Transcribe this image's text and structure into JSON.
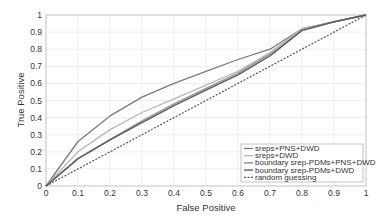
{
  "chart_data": {
    "type": "line",
    "title": "",
    "xlabel": "False Positive",
    "ylabel": "True Positive",
    "xlim": [
      0,
      1
    ],
    "ylim": [
      0,
      1
    ],
    "grid": true,
    "legend_position": "lower right",
    "x_ticks": [
      "0",
      "0.1",
      "0.2",
      "0.3",
      "0.4",
      "0.5",
      "0.6",
      "0.7",
      "0.8",
      "0.9",
      "1"
    ],
    "y_ticks": [
      "0",
      "0.1",
      "0.2",
      "0.3",
      "0.4",
      "0.5",
      "0.6",
      "0.7",
      "0.8",
      "0.9",
      "1"
    ],
    "x": [
      0,
      0.1,
      0.2,
      0.3,
      0.4,
      0.5,
      0.6,
      0.7,
      0.8,
      0.9,
      1
    ],
    "series": [
      {
        "name": "sreps+PNS+DWD",
        "color": "#7a7a7a",
        "width": 1.3,
        "dash": "",
        "values": [
          0,
          0.26,
          0.41,
          0.52,
          0.6,
          0.67,
          0.74,
          0.8,
          0.92,
          0.96,
          1
        ]
      },
      {
        "name": "sreps+DWD",
        "color": "#b8b8b8",
        "width": 1.3,
        "dash": "",
        "values": [
          0,
          0.2,
          0.33,
          0.43,
          0.51,
          0.59,
          0.67,
          0.78,
          0.92,
          0.96,
          1
        ]
      },
      {
        "name": "boundary srep-PDMs+PNS+DWD",
        "color": "#9a9a9a",
        "width": 1.6,
        "dash": "",
        "values": [
          0,
          0.16,
          0.27,
          0.38,
          0.48,
          0.57,
          0.66,
          0.77,
          0.91,
          0.96,
          1
        ]
      },
      {
        "name": "boundary srep-PDMs+DWD",
        "color": "#5e5e5e",
        "width": 1.4,
        "dash": "",
        "values": [
          0,
          0.16,
          0.27,
          0.37,
          0.47,
          0.56,
          0.65,
          0.76,
          0.91,
          0.96,
          1
        ]
      },
      {
        "name": "random guessing",
        "color": "#555555",
        "width": 1.2,
        "dash": "2,1.5",
        "values": [
          0,
          0.1,
          0.2,
          0.3,
          0.4,
          0.5,
          0.6,
          0.7,
          0.8,
          0.9,
          1
        ]
      }
    ]
  }
}
